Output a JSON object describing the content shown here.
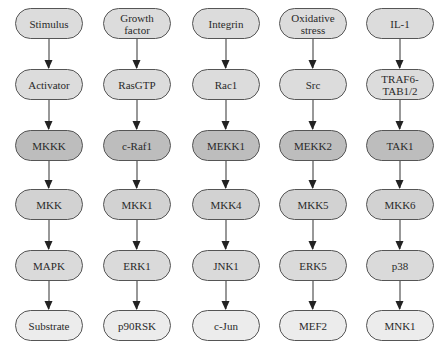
{
  "diagram": {
    "type": "signaling-cascade",
    "row_colors": [
      "#dcdcdc",
      "#dcdcdc",
      "#bdbdbd",
      "#d2d2d2",
      "#dadada",
      "#ececec"
    ],
    "rows": [
      {
        "label": "stimulus"
      },
      {
        "label": "activator"
      },
      {
        "label": "mkkk"
      },
      {
        "label": "mkk"
      },
      {
        "label": "mapk"
      },
      {
        "label": "substrate"
      }
    ],
    "columns": [
      {
        "nodes": [
          "Stimulus",
          "Activator",
          "MKKK",
          "MKK",
          "MAPK",
          "Substrate"
        ]
      },
      {
        "nodes": [
          "Growth factor",
          "RasGTP",
          "c-Raf1",
          "MKK1",
          "ERK1",
          "p90RSK"
        ]
      },
      {
        "nodes": [
          "Integrin",
          "Rac1",
          "MEKK1",
          "MKK4",
          "JNK1",
          "c-Jun"
        ]
      },
      {
        "nodes": [
          "Oxidative stress",
          "Src",
          "MEKK2",
          "MKK5",
          "ERK5",
          "MEF2"
        ]
      },
      {
        "nodes": [
          "IL-1",
          "TRAF6-TAB1/2",
          "TAK1",
          "MKK6",
          "p38",
          "MNK1"
        ]
      }
    ],
    "edges": "each node points down to the next node in the same column"
  }
}
